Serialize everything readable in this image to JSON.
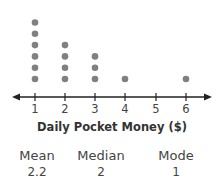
{
  "chart_data": {
    "type": "dot_plot",
    "title": "",
    "xlabel": "Daily Pocket Money ($)",
    "ylabel": "",
    "categories": [
      1,
      2,
      3,
      4,
      5,
      6
    ],
    "values": [
      6,
      4,
      3,
      1,
      0,
      1
    ],
    "xlim": [
      0.5,
      6.5
    ],
    "grid": false,
    "dot_color": "#808080",
    "axis_color": "#222222"
  },
  "stats": {
    "mean": {
      "label": "Mean",
      "value": "2.2"
    },
    "median": {
      "label": "Median",
      "value": "2"
    },
    "mode": {
      "label": "Mode",
      "value": "1"
    }
  }
}
